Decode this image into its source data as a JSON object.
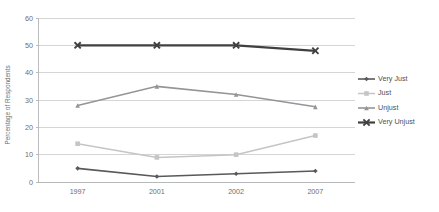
{
  "chart_data": {
    "type": "line",
    "title": "",
    "xlabel": "",
    "ylabel": "Percentage of Respondents",
    "categories": [
      "1997",
      "2001",
      "2002",
      "2007"
    ],
    "ylim": [
      0,
      60
    ],
    "yticks": [
      0,
      10,
      20,
      30,
      40,
      50,
      60
    ],
    "grid": true,
    "legend_position": "right",
    "series": [
      {
        "name": "Very Just",
        "values": [
          5,
          2,
          3,
          4
        ],
        "color": "#58595b",
        "marker": "diamond",
        "line_width": 1.6
      },
      {
        "name": "Just",
        "values": [
          14,
          9,
          10,
          17
        ],
        "color": "#c4c5c7",
        "marker": "square",
        "line_width": 1.5
      },
      {
        "name": "Unjust",
        "values": [
          28,
          35,
          32,
          27.5
        ],
        "color": "#949598",
        "marker": "triangle",
        "line_width": 1.6
      },
      {
        "name": "Very Unjust",
        "values": [
          50,
          50,
          50,
          48
        ],
        "color": "#404042",
        "marker": "x",
        "line_width": 2.2
      }
    ]
  },
  "axis": {
    "y_tick_labels": [
      "0",
      "10",
      "20",
      "30",
      "40",
      "50",
      "60"
    ],
    "x_tick_labels": [
      "1997",
      "2001",
      "2002",
      "2007"
    ],
    "y_axis_title": "Percentage of Respondents"
  },
  "legend": {
    "entries": [
      {
        "label": "Very Just"
      },
      {
        "label": "Just"
      },
      {
        "label": "Unjust"
      },
      {
        "label": "Very Unjust"
      }
    ]
  },
  "colors": {
    "background": "#ffffff",
    "gridline": "#c9cacc",
    "frame": "#b4b5b7",
    "text": "#6d6e71"
  }
}
